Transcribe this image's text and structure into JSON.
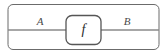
{
  "diagram": {
    "kind": "string-diagram",
    "background_color": "#ffffff",
    "outer_box": {
      "label": "",
      "stroke_color": "#6b6b6b",
      "fill_color": "#ffffff",
      "stroke_width": 1,
      "corner_radius": 5,
      "x": 8,
      "y": 4.5,
      "width": 151,
      "height": 45
    },
    "wire": {
      "label": "",
      "color": "#8a8a8a",
      "stroke_width": 1.4,
      "y": 30,
      "x_start": 8,
      "x_end": 159
    },
    "wire_labels": [
      {
        "text": "A",
        "x": 40,
        "y": 25,
        "font_size": 11
      },
      {
        "text": "B",
        "x": 127,
        "y": 25,
        "font_size": 11
      }
    ],
    "morphism_box": {
      "label": "f",
      "stroke_color": "#565656",
      "fill_color": "#ffffff",
      "stroke_width": 1.3,
      "corner_radius": 6,
      "x": 66,
      "y": 15.5,
      "width": 35,
      "height": 29,
      "label_x": 83.5,
      "label_y": 34,
      "label_font_size": 14
    }
  }
}
